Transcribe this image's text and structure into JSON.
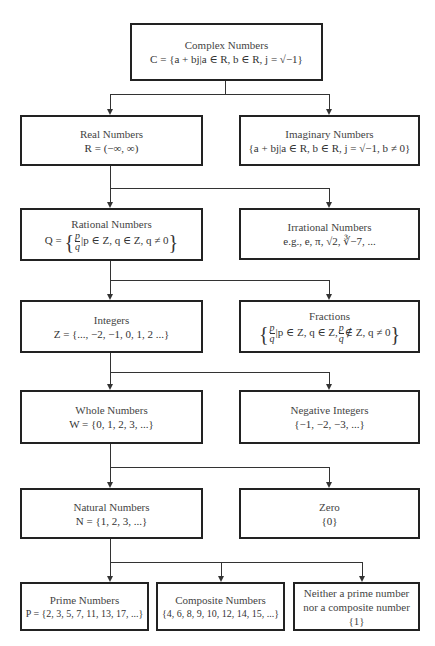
{
  "diagram": {
    "type": "hierarchy",
    "nodes": {
      "complex": {
        "title": "Complex Numbers",
        "formula": "C = {a + bj|a ∈ R, b ∈ R, j = √−1}"
      },
      "real": {
        "title": "Real Numbers",
        "formula": "R = (−∞, ∞)"
      },
      "imaginary": {
        "title": "Imaginary Numbers",
        "formula": "{a + bj|a ∈ R, b ∈ R, j = √−1, b ≠ 0}"
      },
      "rational": {
        "title": "Rational Numbers",
        "formula_prefix": "Q = ",
        "formula_suffix": "|p ∈ Z, q ∈ Z, q ≠ 0",
        "frac_num": "p",
        "frac_den": "q"
      },
      "irrational": {
        "title": "Irrational Numbers",
        "formula": "e.g., e, π, √2, ∛−7, ..."
      },
      "integers": {
        "title": "Integers",
        "formula": "Z = {..., −2, −1, 0, 1, 2 ...}"
      },
      "fractions": {
        "title": "Fractions",
        "formula_mid": "|p ∈ Z, q ∈ Z,",
        "formula_suffix": "∉ Z, q ≠ 0",
        "frac_num": "p",
        "frac_den": "q"
      },
      "whole": {
        "title": "Whole Numbers",
        "formula": "W = {0, 1, 2, 3, ...}"
      },
      "negative": {
        "title": "Negative Integers",
        "formula": "{−1, −2, −3, ...}"
      },
      "natural": {
        "title": "Natural Numbers",
        "formula": "N = {1, 2, 3, ...}"
      },
      "zero": {
        "title": "Zero",
        "formula": "{0}"
      },
      "prime": {
        "title": "Prime Numbers",
        "formula": "P = {2, 3, 5, 7, 11, 13, 17, ...}"
      },
      "composite": {
        "title": "Composite Numbers",
        "formula": "{4, 6, 8, 9, 10, 12, 14, 15, ...}"
      },
      "neither": {
        "title": "Neither a prime number",
        "formula": "nor a composite number {1}"
      }
    },
    "edges": [
      [
        "complex",
        "real"
      ],
      [
        "complex",
        "imaginary"
      ],
      [
        "real",
        "rational"
      ],
      [
        "real",
        "irrational"
      ],
      [
        "rational",
        "integers"
      ],
      [
        "rational",
        "fractions"
      ],
      [
        "integers",
        "whole"
      ],
      [
        "integers",
        "negative"
      ],
      [
        "whole",
        "natural"
      ],
      [
        "whole",
        "zero"
      ],
      [
        "natural",
        "prime"
      ],
      [
        "natural",
        "composite"
      ],
      [
        "natural",
        "neither"
      ]
    ]
  }
}
